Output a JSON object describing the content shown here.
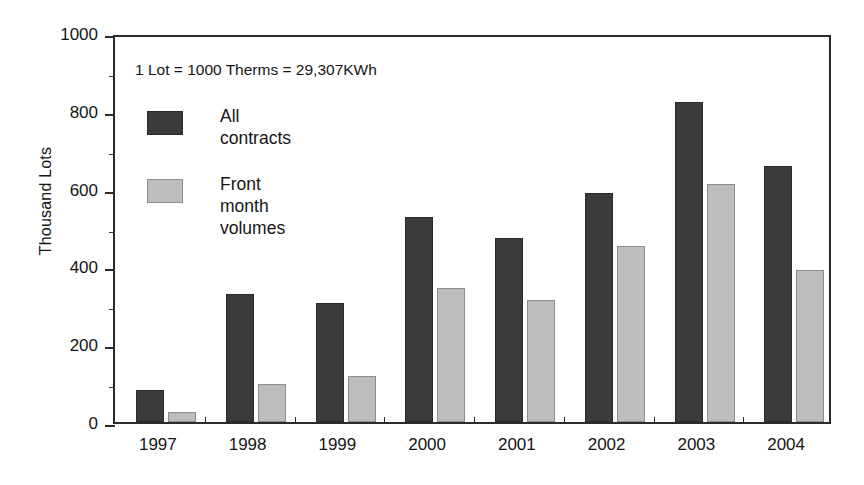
{
  "chart_data": {
    "type": "bar",
    "title": "",
    "subtitle": "",
    "xlabel": "",
    "ylabel": "Thousand Lots",
    "categories": [
      "1997",
      "1998",
      "1999",
      "2000",
      "2001",
      "2002",
      "2003",
      "2004"
    ],
    "series": [
      {
        "name": "All contracts",
        "color": "#3a3a3a",
        "values": [
          82,
          328,
          305,
          527,
          473,
          590,
          822,
          657
        ]
      },
      {
        "name": "Front month volumes",
        "color": "#bdbdbd",
        "values": [
          26,
          98,
          119,
          344,
          313,
          452,
          613,
          391
        ]
      }
    ],
    "ylim": [
      0,
      1000
    ],
    "ytick_labels": [
      "0",
      "200",
      "400",
      "600",
      "800",
      "1000"
    ],
    "ytick_values": [
      0,
      200,
      400,
      600,
      800,
      1000
    ],
    "yminor_values": [
      100,
      300,
      500,
      700,
      900
    ],
    "grid": false,
    "legend_position": "inside-upper-left",
    "annotations": [
      "1 Lot = 1000 Therms = 29,307KWh"
    ]
  },
  "annotation": {
    "text": "1 Lot = 1000 Therms = 29,307KWh"
  },
  "legend": {
    "items": [
      {
        "label": "All contracts",
        "color": "#3a3a3a"
      },
      {
        "label": "Front month\nvolumes",
        "color": "#bdbdbd"
      }
    ]
  },
  "axes": {
    "y_title": "Thousand Lots"
  },
  "colors": {
    "dark_series": "#3a3a3a",
    "light_series": "#bdbdbd",
    "axis": "#2b2b2b",
    "text": "#151515",
    "background": "#ffffff"
  }
}
